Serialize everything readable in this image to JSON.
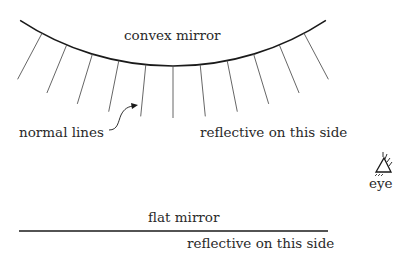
{
  "labels": {
    "convex_mirror": "convex mirror",
    "normal_lines": "normal lines",
    "convex_reflective": "reflective on this side",
    "eye": "eye",
    "flat_mirror": "flat mirror",
    "flat_reflective": "reflective on this side"
  },
  "geometry": {
    "arc_center": [
      173,
      -213
    ],
    "arc_radius": 279,
    "normal_count": 11,
    "normal_length": 52,
    "normal_max_angle_deg": 28
  },
  "colors": {
    "stroke": "#1a1a1a",
    "normal_stroke": "#555555",
    "text": "#2a2a2a"
  }
}
